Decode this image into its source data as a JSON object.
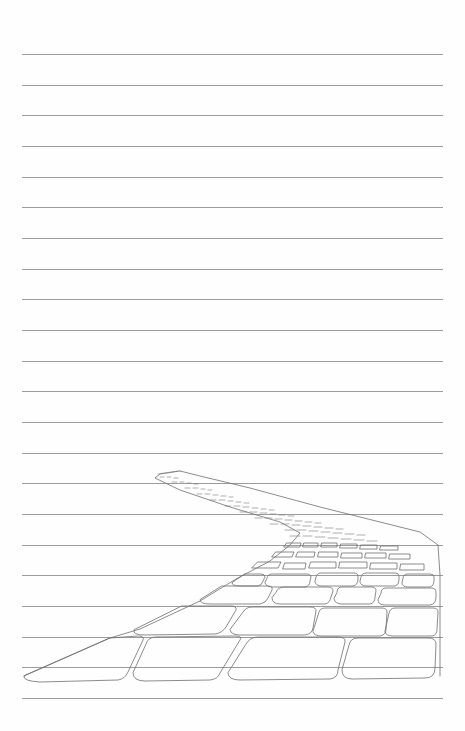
{
  "page": {
    "type": "lined notebook page",
    "background_color": "#fefefe",
    "line_color": "#9c9c9c",
    "line_count": 22,
    "first_line_y": 54,
    "line_spacing": 30.67,
    "line_left": 22,
    "line_right": 443
  },
  "illustration": {
    "subject": "pencil sketch of a cobblestone path receding into the distance",
    "stroke_color": "#6e6e6e"
  }
}
